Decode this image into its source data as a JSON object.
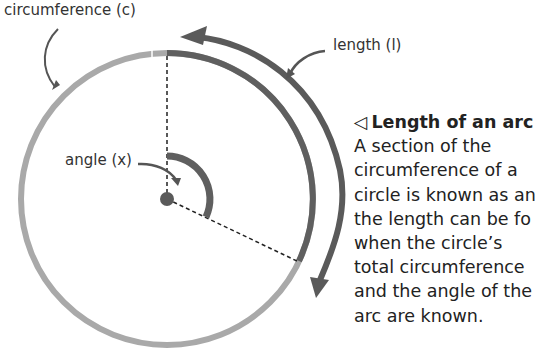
{
  "labels": {
    "circumference": "circumference (c)",
    "length": "length (l)",
    "angle": "angle (x)"
  },
  "caption": {
    "marker": "◁",
    "title": "Length of an arc",
    "lines": [
      "A section of the",
      "circumference of a",
      "circle is known as an",
      "the length can be fo",
      "when the circle’s",
      "total circumference",
      "and the angle of the",
      "arc are known."
    ]
  },
  "colors": {
    "circle": "#a8a8a8",
    "arc": "#5f5f5f",
    "arrow": "#5a5a5a",
    "text": "#222222"
  }
}
